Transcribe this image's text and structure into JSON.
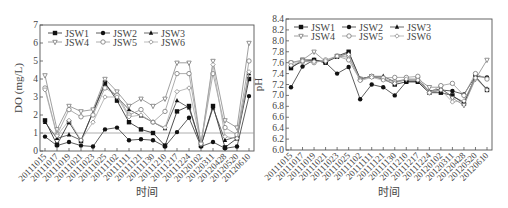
{
  "chart_data": [
    {
      "type": "line",
      "title": "",
      "xlabel": "时间",
      "ylabel": "DO (mg/L)",
      "ylim": [
        0,
        7
      ],
      "yticks": [
        0,
        1,
        2,
        3,
        4,
        5,
        6,
        7
      ],
      "reference_line": 1,
      "grid": false,
      "legend_position": "top-left inside",
      "categories": [
        "20111015",
        "20111017",
        "20111019",
        "20111021",
        "20111023",
        "20111025",
        "20111102",
        "20111111",
        "20111121",
        "20111130",
        "20111210",
        "20111217",
        "20111224",
        "20120102",
        "20120311",
        "20120428",
        "20120520",
        "20120610"
      ],
      "series": [
        {
          "name": "JSW1",
          "marker": "filled-square",
          "values": [
            1.7,
            0.35,
            1.6,
            0.55,
            null,
            3.8,
            2.8,
            1.6,
            1.2,
            1.0,
            0.3,
            2.2,
            2.5,
            0.3,
            2.5,
            0.2,
            0.7,
            4.0
          ]
        },
        {
          "name": "JSW2",
          "marker": "filled-circle",
          "values": [
            0.8,
            0.3,
            0.5,
            0.3,
            0.25,
            1.2,
            1.3,
            0.6,
            0.65,
            0.6,
            0.25,
            1.05,
            1.85,
            0.25,
            0.5,
            0.15,
            0.25,
            3.05
          ]
        },
        {
          "name": "JSW3",
          "marker": "filled-triangle",
          "values": [
            1.6,
            0.7,
            0.9,
            0.6,
            null,
            3.7,
            3.0,
            2.3,
            1.95,
            1.6,
            1.25,
            2.8,
            2.4,
            0.3,
            2.4,
            0.6,
            0.8,
            4.3
          ]
        },
        {
          "name": "JSW4",
          "marker": "open-triangle-down",
          "values": [
            4.2,
            1.2,
            2.5,
            2.2,
            2.3,
            4.0,
            3.3,
            2.5,
            2.9,
            2.5,
            2.9,
            4.9,
            4.9,
            0.4,
            5.0,
            1.7,
            1.3,
            6.0
          ]
        },
        {
          "name": "JSW5",
          "marker": "open-circle",
          "values": [
            3.5,
            0.9,
            2.3,
            1.9,
            2.0,
            3.5,
            3.1,
            2.0,
            2.3,
            1.6,
            2.2,
            4.3,
            4.3,
            0.4,
            4.3,
            1.3,
            0.9,
            5.0
          ]
        },
        {
          "name": "JSW6",
          "marker": "open-diamond",
          "values": [
            3.4,
            0.85,
            1.7,
            0.6,
            1.6,
            3.0,
            3.0,
            1.9,
            2.0,
            1.6,
            1.3,
            3.3,
            3.5,
            0.4,
            4.8,
            0.8,
            0.7,
            4.4
          ]
        }
      ]
    },
    {
      "type": "line",
      "title": "",
      "xlabel": "时间",
      "ylabel": "pH",
      "ylim": [
        6.0,
        8.4
      ],
      "yticks": [
        6.0,
        6.2,
        6.4,
        6.6,
        6.8,
        7.0,
        7.2,
        7.4,
        7.6,
        7.8,
        8.0,
        8.2,
        8.4
      ],
      "grid": false,
      "legend_position": "top-left inside",
      "categories": [
        "20111015",
        "20111017",
        "20111019",
        "20111021",
        "20111023",
        "20111025",
        "20111102",
        "20111111",
        "20111121",
        "20111130",
        "20111210",
        "20111217",
        "20111224",
        "20120102",
        "20120311",
        "20120428",
        "20120520",
        "20120610"
      ],
      "series": [
        {
          "name": "JSW1",
          "marker": "filled-square",
          "values": [
            7.5,
            7.65,
            7.65,
            7.6,
            7.72,
            7.8,
            7.3,
            7.35,
            7.3,
            7.2,
            7.25,
            7.25,
            7.05,
            7.05,
            7.0,
            6.85,
            7.35,
            7.1
          ]
        },
        {
          "name": "JSW2",
          "marker": "filled-circle",
          "values": [
            7.15,
            7.53,
            7.65,
            7.6,
            7.4,
            7.52,
            6.93,
            7.2,
            7.15,
            7.0,
            7.25,
            7.25,
            7.05,
            7.1,
            7.08,
            7.02,
            7.35,
            7.33
          ]
        },
        {
          "name": "JSW3",
          "marker": "filled-triangle",
          "values": [
            7.52,
            7.62,
            7.65,
            7.62,
            7.7,
            7.78,
            7.3,
            7.35,
            7.35,
            7.25,
            7.28,
            7.28,
            7.08,
            7.12,
            6.98,
            6.88,
            7.33,
            7.12
          ]
        },
        {
          "name": "JSW4",
          "marker": "open-triangle-down",
          "values": [
            7.6,
            7.65,
            7.8,
            7.62,
            7.72,
            7.7,
            7.3,
            7.35,
            7.3,
            7.25,
            7.3,
            7.3,
            7.15,
            7.15,
            6.95,
            6.82,
            7.3,
            7.65
          ]
        },
        {
          "name": "JSW5",
          "marker": "open-circle",
          "values": [
            7.6,
            7.63,
            7.6,
            7.65,
            7.72,
            7.65,
            7.28,
            7.35,
            7.32,
            7.33,
            7.33,
            7.35,
            7.05,
            7.18,
            7.22,
            7.0,
            7.4,
            7.3
          ]
        },
        {
          "name": "JSW6",
          "marker": "open-diamond",
          "values": [
            7.55,
            7.63,
            7.62,
            7.63,
            7.72,
            7.75,
            7.27,
            7.33,
            7.28,
            7.22,
            7.3,
            7.28,
            7.05,
            7.1,
            6.88,
            6.9,
            7.32,
            7.1
          ]
        }
      ]
    }
  ]
}
